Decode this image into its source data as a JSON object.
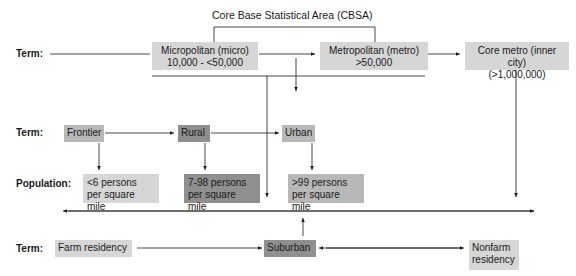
{
  "diagram": {
    "title": "Core Base Statistical Area (CBSA)",
    "row_labels": {
      "term_top": "Term:",
      "term_middle": "Term:",
      "population": "Population:",
      "term_bottom": "Term:"
    },
    "top_row": {
      "micro": {
        "line1": "Micropolitan (micro)",
        "line2": "10,000 - <50,000"
      },
      "metro": {
        "line1": "Metropolitan (metro)",
        "line2": ">50,000"
      },
      "core": {
        "line1": "Core metro (inner city)",
        "line2": "(>1,000,000)"
      }
    },
    "middle_row": {
      "frontier": "Frontier",
      "rural": "Rural",
      "urban": "Urban"
    },
    "population_row": {
      "frontier_pop": {
        "line1": "<6 persons",
        "line2": "per square mile"
      },
      "rural_pop": {
        "line1": "7-98 persons",
        "line2": "per square mile"
      },
      "urban_pop": {
        "line1": ">99 persons",
        "line2": "per square mile"
      }
    },
    "bottom_row": {
      "farm": "Farm residency",
      "suburban": "Suburban",
      "nonfarm": {
        "line1": "Nonfarm",
        "line2": "residency"
      }
    },
    "colors": {
      "light": "#d6d6d6",
      "mid": "#b8b8b8",
      "dark": "#8f8f8f",
      "line": "#1a1a1a"
    }
  }
}
